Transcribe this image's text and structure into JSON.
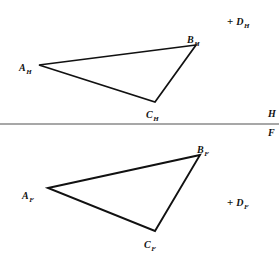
{
  "figure": {
    "type": "descriptive-geometry-orthographic-projection",
    "background_color": "#ffffff",
    "line_color": "#111111",
    "fold_line_color": "#8a8a8a",
    "width": 279,
    "height": 259
  },
  "fold_line": {
    "label_top": "H",
    "label_bottom": "F",
    "y": 124,
    "x_start": 0,
    "x_end": 279,
    "label_x": 268
  },
  "horizontal_view": {
    "name": "H",
    "triangle": {
      "vertices": [
        {
          "id": "A_H",
          "base": "A",
          "sub": "H",
          "x": 39,
          "y": 65,
          "label_x": 19,
          "label_y": 58
        },
        {
          "id": "B_H",
          "base": "B",
          "sub": "H",
          "x": 196,
          "y": 45,
          "label_x": 187,
          "label_y": 30
        },
        {
          "id": "C_H",
          "base": "C",
          "sub": "H",
          "x": 155,
          "y": 102,
          "label_x": 146,
          "label_y": 105
        }
      ],
      "closed": true
    },
    "point": {
      "id": "D_H",
      "plus": "+",
      "base": "D",
      "sub": "H",
      "label_x": 227,
      "label_y": 12
    }
  },
  "frontal_view": {
    "name": "F",
    "triangle": {
      "vertices": [
        {
          "id": "A_F",
          "base": "A",
          "sub": "F",
          "x": 48,
          "y": 188,
          "label_x": 22,
          "label_y": 186
        },
        {
          "id": "B_F",
          "base": "B",
          "sub": "F",
          "x": 200,
          "y": 155,
          "label_x": 197,
          "label_y": 140
        },
        {
          "id": "C_F",
          "base": "C",
          "sub": "F",
          "x": 155,
          "y": 231,
          "label_x": 144,
          "label_y": 235
        }
      ],
      "closed": true
    },
    "point": {
      "id": "D_F",
      "plus": "+",
      "base": "D",
      "sub": "F",
      "label_x": 227,
      "label_y": 193
    }
  }
}
